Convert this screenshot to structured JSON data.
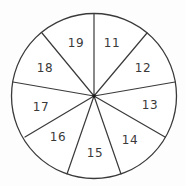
{
  "diagram": {
    "type": "spinner",
    "section_count": 9,
    "colors": {
      "stroke": "#3a3a3a",
      "fill": "#ffffff",
      "hub": "#1a1a1a",
      "text": "#3a3a3a"
    },
    "sections": [
      {
        "label": "11"
      },
      {
        "label": "12"
      },
      {
        "label": "13"
      },
      {
        "label": "14"
      },
      {
        "label": "15"
      },
      {
        "label": "16"
      },
      {
        "label": "17"
      },
      {
        "label": "18"
      },
      {
        "label": "19"
      }
    ]
  }
}
